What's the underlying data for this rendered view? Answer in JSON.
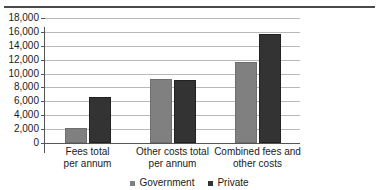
{
  "chart_data": {
    "type": "bar",
    "title": "",
    "xlabel": "",
    "ylabel": "",
    "ylim": [
      0,
      18000
    ],
    "ytick_step": 2000,
    "yticks": [
      "18,000",
      "16,000",
      "14,000",
      "12,000",
      "10,000",
      "8,000",
      "6,000",
      "4,000",
      "2,000",
      "0"
    ],
    "ytick_values": [
      18000,
      16000,
      14000,
      12000,
      10000,
      8000,
      6000,
      4000,
      2000,
      0
    ],
    "grid": true,
    "legend_position": "bottom",
    "categories": [
      "Fees total per annum",
      "Other costs total per annum",
      "Combined fees and other costs"
    ],
    "category_lines": [
      [
        "Fees total",
        "per annum"
      ],
      [
        "Other costs total",
        "per annum"
      ],
      [
        "Combined fees and",
        "other costs"
      ]
    ],
    "series": [
      {
        "name": "Government",
        "color": "#808080",
        "values": [
          2200,
          9200,
          11700
        ]
      },
      {
        "name": "Private",
        "color": "#333333",
        "values": [
          6600,
          9050,
          15700
        ]
      }
    ]
  },
  "legend": {
    "items": [
      {
        "label": "Government"
      },
      {
        "label": "Private"
      }
    ]
  },
  "colors": {
    "government": "#808080",
    "private": "#333333",
    "gridline": "#b9b9b9",
    "axis": "#555555"
  }
}
